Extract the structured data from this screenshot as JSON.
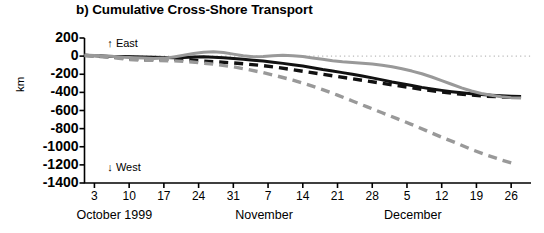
{
  "chart_data": {
    "type": "line",
    "title": "b) Cumulative Cross-Shore Transport",
    "xlabel": "",
    "ylabel": "km",
    "ylim": [
      -1400,
      200
    ],
    "yticks": [
      200,
      0,
      -200,
      -400,
      -600,
      -800,
      -1000,
      -1200,
      -1400
    ],
    "ytick_labels": [
      "200",
      "0",
      "-200",
      "-400",
      "-600",
      "-800",
      "-1000",
      "-1200",
      "-1400"
    ],
    "xlim": [
      0,
      90
    ],
    "xticks": [
      2,
      9,
      16,
      23,
      30,
      37,
      44,
      51,
      58,
      65,
      72,
      79,
      86
    ],
    "xtick_labels": [
      "3",
      "10",
      "17",
      "24",
      "31",
      "7",
      "14",
      "21",
      "28",
      "5",
      "12",
      "19",
      "26"
    ],
    "month_labels": [
      {
        "text": "October 1999",
        "x": 2
      },
      {
        "text": "November",
        "x": 34
      },
      {
        "text": "December",
        "x": 64
      }
    ],
    "grid": false,
    "zero_line": true,
    "zero_line_style": "dotted",
    "legend_position": "none",
    "annotations": [
      {
        "text": "↑ East",
        "x": 4,
        "y": 120
      },
      {
        "text": "↓ West",
        "x": 4,
        "y": -1250
      }
    ],
    "colors": {
      "black": "#111111",
      "gray": "#999999",
      "axis": "#000000",
      "zero_line": "#b9b9b9"
    },
    "series": [
      {
        "name": "black-solid",
        "style": "solid",
        "color": "#111111",
        "x": [
          0,
          2,
          4,
          6,
          8,
          10,
          12,
          14,
          16,
          18,
          20,
          22,
          24,
          26,
          28,
          30,
          32,
          34,
          36,
          38,
          40,
          42,
          44,
          46,
          48,
          50,
          52,
          54,
          56,
          58,
          60,
          62,
          64,
          66,
          68,
          70,
          72,
          74,
          76,
          78,
          80,
          82,
          84,
          86,
          88
        ],
        "values": [
          10,
          5,
          0,
          -5,
          -5,
          -8,
          -10,
          -12,
          -15,
          -18,
          -15,
          -10,
          -8,
          -12,
          -18,
          -25,
          -35,
          -45,
          -55,
          -68,
          -80,
          -95,
          -110,
          -128,
          -148,
          -165,
          -182,
          -200,
          -220,
          -240,
          -262,
          -285,
          -305,
          -325,
          -345,
          -362,
          -378,
          -392,
          -404,
          -414,
          -424,
          -432,
          -438,
          -442,
          -445
        ]
      },
      {
        "name": "black-dashed",
        "style": "dashed",
        "color": "#111111",
        "x": [
          0,
          3,
          6,
          9,
          12,
          15,
          18,
          21,
          24,
          27,
          30,
          33,
          36,
          39,
          42,
          45,
          48,
          51,
          54,
          57,
          60,
          63,
          66,
          69,
          72,
          75,
          78,
          81,
          84,
          87
        ],
        "values": [
          8,
          0,
          -10,
          -30,
          -40,
          -38,
          -35,
          -40,
          -55,
          -65,
          -75,
          -90,
          -105,
          -125,
          -150,
          -175,
          -200,
          -225,
          -250,
          -275,
          -300,
          -325,
          -350,
          -375,
          -395,
          -415,
          -430,
          -442,
          -450,
          -455
        ]
      },
      {
        "name": "gray-solid",
        "style": "solid",
        "color": "#999999",
        "x": [
          0,
          2,
          4,
          6,
          8,
          10,
          12,
          14,
          16,
          18,
          20,
          22,
          24,
          26,
          28,
          30,
          32,
          34,
          36,
          38,
          40,
          42,
          44,
          46,
          48,
          50,
          52,
          54,
          56,
          58,
          60,
          62,
          64,
          66,
          68,
          70,
          72,
          74,
          76,
          78,
          80,
          82,
          84,
          86,
          88
        ],
        "values": [
          12,
          8,
          2,
          -5,
          -12,
          -18,
          -22,
          -25,
          -22,
          -10,
          10,
          28,
          42,
          48,
          40,
          22,
          5,
          -8,
          -5,
          5,
          10,
          5,
          -5,
          -20,
          -35,
          -50,
          -62,
          -70,
          -78,
          -88,
          -100,
          -118,
          -140,
          -165,
          -195,
          -230,
          -270,
          -310,
          -350,
          -385,
          -412,
          -432,
          -448,
          -458,
          -462
        ]
      },
      {
        "name": "gray-dashed",
        "style": "dashed",
        "color": "#999999",
        "x": [
          0,
          3,
          6,
          9,
          12,
          15,
          18,
          21,
          24,
          27,
          30,
          33,
          36,
          39,
          42,
          45,
          48,
          51,
          54,
          57,
          60,
          63,
          66,
          69,
          72,
          75,
          78,
          81,
          84,
          87
        ],
        "values": [
          5,
          -5,
          -18,
          -38,
          -45,
          -48,
          -52,
          -62,
          -78,
          -95,
          -118,
          -148,
          -182,
          -222,
          -265,
          -315,
          -370,
          -430,
          -495,
          -560,
          -625,
          -690,
          -755,
          -825,
          -895,
          -960,
          -1030,
          -1090,
          -1145,
          -1195
        ]
      }
    ]
  }
}
